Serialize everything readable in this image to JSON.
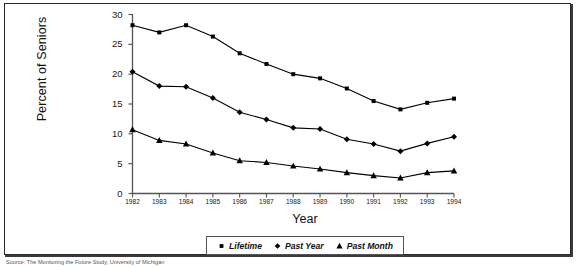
{
  "chart_data": {
    "type": "line",
    "title": "",
    "subtitle": "",
    "xlabel": "Year",
    "ylabel": "Percent of Seniors",
    "categories": [
      "1982",
      "1983",
      "1984",
      "1985",
      "1986",
      "1987",
      "1988",
      "1989",
      "1990",
      "1991",
      "1992",
      "1993",
      "1994"
    ],
    "x": [
      1982,
      1983,
      1984,
      1985,
      1986,
      1987,
      1988,
      1989,
      1990,
      1991,
      1992,
      1993,
      1994
    ],
    "xlim": [
      1982,
      1994
    ],
    "ylim": [
      0,
      30
    ],
    "yticks": [
      0,
      5,
      10,
      15,
      20,
      25,
      30
    ],
    "ytick_labels": [
      "0",
      "5",
      "10",
      "15",
      "20",
      "25",
      "30"
    ],
    "grid": false,
    "legend_position": "bottom-center",
    "series": [
      {
        "name": "Lifetime",
        "marker": "square",
        "color": "#000000",
        "values": [
          28.2,
          27.0,
          28.2,
          26.3,
          23.5,
          21.7,
          20.0,
          19.3,
          17.6,
          15.5,
          14.1,
          15.2,
          15.9
        ]
      },
      {
        "name": "Past Year",
        "marker": "diamond",
        "color": "#000000",
        "values": [
          20.4,
          18.0,
          17.9,
          16.0,
          13.6,
          12.4,
          11.0,
          10.8,
          9.1,
          8.3,
          7.1,
          8.4,
          9.5
        ]
      },
      {
        "name": "Past Month",
        "marker": "triangle",
        "color": "#000000",
        "values": [
          10.7,
          8.9,
          8.3,
          6.8,
          5.5,
          5.2,
          4.6,
          4.1,
          3.5,
          3.0,
          2.6,
          3.5,
          3.8
        ]
      }
    ]
  },
  "axes": {
    "ylabel": "Percent of Seniors",
    "xlabel": "Year"
  },
  "legend": {
    "items": [
      {
        "label": "Lifetime",
        "marker": "square"
      },
      {
        "label": "Past Year",
        "marker": "diamond"
      },
      {
        "label": "Past Month",
        "marker": "triangle"
      }
    ]
  },
  "source_note": "Source: The Monitoring the Future Study, University of Michigan",
  "colors": {
    "line": "#000000",
    "axis": "#555555",
    "frame": "#2a2a2a",
    "text": "#111111",
    "background": "#ffffff"
  }
}
